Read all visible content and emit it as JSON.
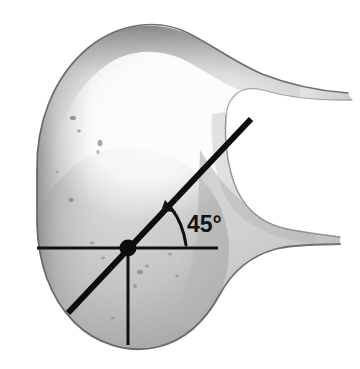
{
  "figure": {
    "kind": "anatomical-specimen-photograph",
    "background_color": "#ffffff",
    "annotation_color": "#101010",
    "specimen": {
      "fill_light": "#fdfdfd",
      "fill_mid": "#c9c9c9",
      "fill_shadow": "#8f8f8f",
      "outline_color": "#6e6e6e"
    }
  },
  "annotations": {
    "angle_label": {
      "text": "45°",
      "x": 187,
      "y": 232
    },
    "horizontal_reference_line": {
      "name": "horizontal-axis-line",
      "x1": 37,
      "y1": 248,
      "x2": 218,
      "y2": 248,
      "stroke_width": 3
    },
    "vertical_reference_line": {
      "name": "vertical-axis-line",
      "x1": 128,
      "y1": 248,
      "x2": 128,
      "y2": 345,
      "stroke_width": 3
    },
    "diagonal_angle_line": {
      "name": "forty-five-degree-line",
      "x1": 68,
      "y1": 313,
      "x2": 251,
      "y2": 119,
      "stroke_width": 6
    },
    "center_point": {
      "name": "vertex-point",
      "cx": 128,
      "cy": 248,
      "r": 8
    },
    "angle_arc_arrow": {
      "name": "angle-arc",
      "path": "M 185 246 C 183 232 178 219 170 209",
      "stroke_width": 3,
      "arrow_tip": {
        "x": 166,
        "y": 204
      }
    }
  },
  "measurements": {
    "angle_degrees": 45,
    "angle_unit": "°"
  }
}
